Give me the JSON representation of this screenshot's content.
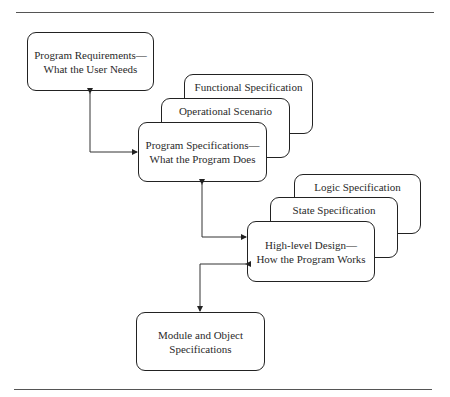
{
  "diagram": {
    "requirements": {
      "line1": "Program Requirements—",
      "line2": "What the User Needs"
    },
    "program_spec": {
      "line1": "Program Specifications—",
      "line2": "What the Program Does",
      "back_layers": [
        "Functional Specification",
        "Operational Scenario"
      ]
    },
    "high_level_design": {
      "line1": "High-level Design—",
      "line2": "How the Program Works",
      "back_layers": [
        "Logic Specification",
        "State Specification"
      ]
    },
    "module": {
      "line1": "Module and Object",
      "line2": "Specifications"
    },
    "connections": [
      {
        "from": "requirements",
        "to": "program_spec",
        "bidirectional": true
      },
      {
        "from": "program_spec",
        "to": "high_level_design",
        "bidirectional": true
      },
      {
        "from": "high_level_design",
        "to": "module",
        "bidirectional": true
      }
    ]
  },
  "colors": {
    "stroke": "#222222",
    "background": "#ffffff",
    "rule": "#555555"
  }
}
